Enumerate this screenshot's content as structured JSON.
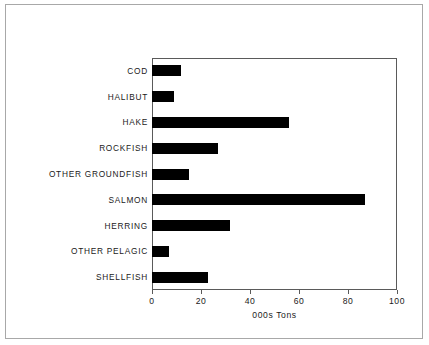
{
  "chart_data": {
    "type": "bar",
    "orientation": "horizontal",
    "title": "",
    "xlabel": "000s Tons",
    "ylabel": "",
    "xlim": [
      0,
      100
    ],
    "xticks": [
      0,
      20,
      40,
      60,
      80,
      100
    ],
    "xtick_labels": [
      "0",
      "20",
      "40",
      "60",
      "80",
      "100"
    ],
    "grid": false,
    "legend": null,
    "bar_color": "#000000",
    "categories": [
      "COD",
      "HALIBUT",
      "HAKE",
      "ROCKFISH",
      "OTHER GROUNDFISH",
      "SALMON",
      "HERRING",
      "OTHER PELAGIC",
      "SHELLFISH"
    ],
    "values": [
      12,
      9,
      56,
      27,
      15,
      87,
      32,
      23,
      7
    ],
    "series": [
      {
        "name": "Catch",
        "values": [
          12,
          9,
          56,
          27,
          15,
          87,
          32,
          7,
          23
        ]
      }
    ],
    "points": [
      {
        "category": "COD",
        "value": 12
      },
      {
        "category": "HALIBUT",
        "value": 9
      },
      {
        "category": "HAKE",
        "value": 56
      },
      {
        "category": "ROCKFISH",
        "value": 27
      },
      {
        "category": "OTHER GROUNDFISH",
        "value": 15
      },
      {
        "category": "SALMON",
        "value": 87
      },
      {
        "category": "HERRING",
        "value": 32
      },
      {
        "category": "OTHER PELAGIC",
        "value": 7
      },
      {
        "category": "SHELLFISH",
        "value": 23
      }
    ]
  }
}
